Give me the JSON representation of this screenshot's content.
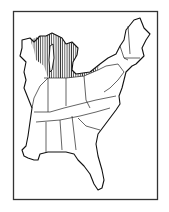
{
  "map": {
    "title": "",
    "region": "Eastern United States",
    "frame": {
      "x": 13,
      "y": 11,
      "width": 145,
      "height": 189,
      "stroke": "#333333"
    },
    "shaded_region": {
      "description": "Vertical hatching over northern Wisconsin, Michigan peninsulas, and northern Indiana/Ohio band",
      "pattern": "vertical-hatch",
      "color": "#222222"
    },
    "colors": {
      "land": "#ffffff",
      "outline": "#111111",
      "background": "#ffffff"
    }
  }
}
